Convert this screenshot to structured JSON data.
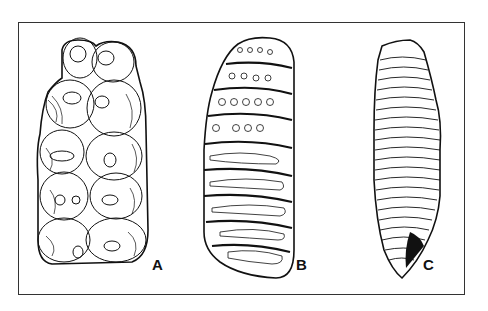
{
  "figure": {
    "panels": [
      {
        "label": "A",
        "subject": "bunodont molar with rounded cusps in paired rows"
      },
      {
        "label": "B",
        "subject": "molar with transverse enamel plates showing loops and rings"
      },
      {
        "label": "C",
        "subject": "elongated molar with many tightly packed transverse enamel lamellae"
      }
    ],
    "colors": {
      "ink": "#111111",
      "background": "#ffffff",
      "frame": "#333333"
    }
  }
}
